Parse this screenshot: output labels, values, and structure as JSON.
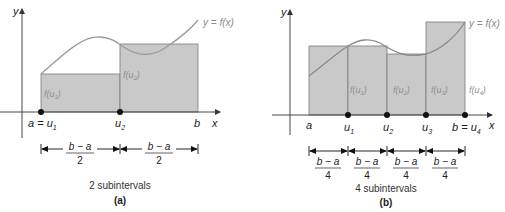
{
  "colors": {
    "rect_fill": "#c9c9c9",
    "rect_stroke": "#7a7a7a",
    "curve": "#9a9a9a",
    "axis": "#333333",
    "point": "#111111",
    "text": "#222222"
  },
  "panel_a": {
    "y_axis_label": "y",
    "x_axis_label": "x",
    "curve_label": "y = f(x)",
    "points": [
      {
        "label": "a = u",
        "sub": "1"
      },
      {
        "label": "u",
        "sub": "2"
      },
      {
        "label": "b",
        "sub": ""
      }
    ],
    "rect_labels": [
      {
        "label": "f(u",
        "sub": "1",
        "close": ")"
      },
      {
        "label": "f(u",
        "sub": "2",
        "close": ")"
      }
    ],
    "interval_numerator": "b − a",
    "interval_denominator": "2",
    "interval_count": 2,
    "caption": "2 subintervals",
    "panel_letter": "(a)"
  },
  "panel_b": {
    "y_axis_label": "y",
    "x_axis_label": "x",
    "curve_label": "y = f(x)",
    "points": [
      {
        "label": "a",
        "sub": ""
      },
      {
        "label": "u",
        "sub": "1"
      },
      {
        "label": "u",
        "sub": "2"
      },
      {
        "label": "u",
        "sub": "3"
      },
      {
        "label": "b = u",
        "sub": "4"
      }
    ],
    "rect_labels": [
      {
        "label": "f(u",
        "sub": "1",
        "close": ")"
      },
      {
        "label": "f(u",
        "sub": "2",
        "close": ")"
      },
      {
        "label": "f(u",
        "sub": "3",
        "close": ")"
      },
      {
        "label": "f(u",
        "sub": "4",
        "close": ")"
      }
    ],
    "interval_numerator": "b − a",
    "interval_denominator": "4",
    "interval_count": 4,
    "caption": "4 subintervals",
    "panel_letter": "(b)"
  }
}
